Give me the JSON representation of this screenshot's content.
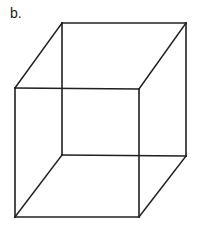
{
  "figure": {
    "label": "b.",
    "caption_position": "top-left",
    "background_color": "#ffffff",
    "shape_name": "wireframe-cube"
  },
  "cube": {
    "stroke_color": "#231f20",
    "stroke_width": 1.6,
    "fill": "none",
    "projection": "oblique",
    "vertices": {
      "front_top_left": [
        15,
        88
      ],
      "front_top_right": [
        139,
        89
      ],
      "front_bottom_right": [
        139,
        217
      ],
      "front_bottom_left": [
        15,
        217
      ],
      "back_top_left": [
        62,
        23
      ],
      "back_top_right": [
        186,
        23
      ],
      "back_bottom_right": [
        186,
        156
      ],
      "back_bottom_left": [
        62,
        155
      ]
    },
    "edges": [
      {
        "name": "front-top",
        "from": "front_top_left",
        "to": "front_top_right"
      },
      {
        "name": "front-right",
        "from": "front_top_right",
        "to": "front_bottom_right"
      },
      {
        "name": "front-bottom",
        "from": "front_bottom_right",
        "to": "front_bottom_left"
      },
      {
        "name": "front-left",
        "from": "front_bottom_left",
        "to": "front_top_left"
      },
      {
        "name": "back-top",
        "from": "back_top_left",
        "to": "back_top_right"
      },
      {
        "name": "back-right",
        "from": "back_top_right",
        "to": "back_bottom_right"
      },
      {
        "name": "back-bottom",
        "from": "back_bottom_right",
        "to": "back_bottom_left"
      },
      {
        "name": "back-left",
        "from": "back_bottom_left",
        "to": "back_top_left"
      },
      {
        "name": "connector-top-left",
        "from": "front_top_left",
        "to": "back_top_left"
      },
      {
        "name": "connector-top-right",
        "from": "front_top_right",
        "to": "back_top_right"
      },
      {
        "name": "connector-bottom-right",
        "from": "front_bottom_right",
        "to": "back_bottom_right"
      },
      {
        "name": "connector-bottom-left",
        "from": "front_bottom_left",
        "to": "back_bottom_left"
      }
    ]
  }
}
